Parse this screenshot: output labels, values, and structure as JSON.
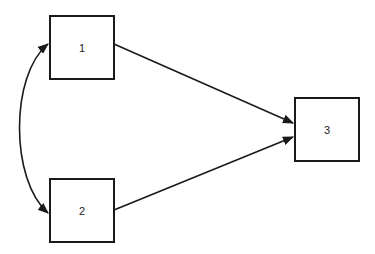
{
  "diagram": {
    "type": "path-diagram",
    "nodes": [
      {
        "id": "1",
        "label": "1"
      },
      {
        "id": "2",
        "label": "2"
      },
      {
        "id": "3",
        "label": "3"
      }
    ],
    "edges": [
      {
        "from": "1",
        "to": "3",
        "style": "straight-arrow"
      },
      {
        "from": "2",
        "to": "3",
        "style": "straight-arrow"
      },
      {
        "from": "1",
        "to": "2",
        "style": "curved-double-arrow"
      }
    ],
    "colors": {
      "stroke": "#1a1a1a",
      "background": "#ffffff"
    }
  }
}
